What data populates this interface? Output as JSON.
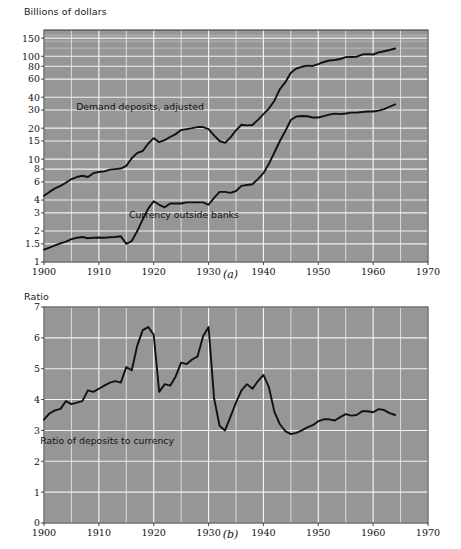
{
  "figure": {
    "background": "#ffffff",
    "plot_background": "#969696",
    "grid_color": "#f2f2f2",
    "line_color": "#111111",
    "axis_color": "#333333"
  },
  "panel_a": {
    "caption": "(a)",
    "axis_title": "Billions of dollars"
  },
  "panel_b": {
    "caption": "(b)",
    "axis_title": "Ratio"
  },
  "chart_data": [
    {
      "type": "line",
      "panel": "(a)",
      "title": "",
      "ylabel": "Billions of dollars",
      "xlabel": "",
      "yscale": "log",
      "ylim": [
        1,
        180
      ],
      "xlim": [
        1900,
        1970
      ],
      "grid": true,
      "legend": "inline-annotations",
      "ytick_labels": [
        "1",
        "1.5",
        "2",
        "3",
        "4",
        "6",
        "8",
        "10",
        "15",
        "20",
        "30",
        "40",
        "60",
        "80",
        "100",
        "150"
      ],
      "ytick_values": [
        1,
        1.5,
        2,
        3,
        4,
        6,
        8,
        10,
        15,
        20,
        30,
        40,
        60,
        80,
        100,
        150
      ],
      "xtick_labels": [
        "1900",
        "1910",
        "1920",
        "1930",
        "1940",
        "1950",
        "1960",
        "1970"
      ],
      "xtick_values": [
        1900,
        1910,
        1920,
        1930,
        1940,
        1950,
        1960,
        1970
      ],
      "series": [
        {
          "name": "Demand deposits, adjusted",
          "label_x": 1917.5,
          "label_y": 30,
          "x": [
            1900,
            1901,
            1902,
            1903,
            1904,
            1905,
            1906,
            1907,
            1908,
            1909,
            1910,
            1911,
            1912,
            1913,
            1914,
            1915,
            1916,
            1917,
            1918,
            1919,
            1920,
            1921,
            1922,
            1923,
            1924,
            1925,
            1926,
            1927,
            1928,
            1929,
            1930,
            1931,
            1932,
            1933,
            1934,
            1935,
            1936,
            1937,
            1938,
            1939,
            1940,
            1941,
            1942,
            1943,
            1944,
            1945,
            1946,
            1947,
            1948,
            1949,
            1950,
            1951,
            1952,
            1953,
            1954,
            1955,
            1956,
            1957,
            1958,
            1959,
            1960,
            1961,
            1962,
            1963,
            1964
          ],
          "y": [
            4.4,
            4.8,
            5.2,
            5.5,
            5.9,
            6.4,
            6.7,
            6.9,
            6.7,
            7.3,
            7.5,
            7.6,
            7.9,
            8.0,
            8.1,
            8.6,
            10.2,
            11.5,
            12.0,
            14.2,
            16.0,
            14.6,
            15.3,
            16.4,
            17.5,
            19.2,
            19.6,
            20.0,
            20.5,
            20.5,
            19.6,
            17.0,
            15.0,
            14.4,
            16.3,
            19.0,
            21.6,
            21.3,
            21.5,
            24.1,
            27.4,
            31.0,
            37.0,
            48.0,
            56.0,
            69.0,
            76.0,
            79.0,
            81.0,
            80.5,
            84.0,
            88.0,
            91.0,
            92.0,
            94.0,
            98.0,
            98.5,
            99.0,
            104.0,
            105.0,
            104.0,
            109.0,
            112.0,
            115.0,
            119.0
          ]
        },
        {
          "name": "Currency outside banks",
          "label_x": 1925.5,
          "label_y": 2.65,
          "x": [
            1900,
            1901,
            1902,
            1903,
            1904,
            1905,
            1906,
            1907,
            1908,
            1909,
            1910,
            1911,
            1912,
            1913,
            1914,
            1915,
            1916,
            1917,
            1918,
            1919,
            1920,
            1921,
            1922,
            1923,
            1924,
            1925,
            1926,
            1927,
            1928,
            1929,
            1930,
            1931,
            1932,
            1933,
            1934,
            1935,
            1936,
            1937,
            1938,
            1939,
            1940,
            1941,
            1942,
            1943,
            1944,
            1945,
            1946,
            1947,
            1948,
            1949,
            1950,
            1951,
            1952,
            1953,
            1954,
            1955,
            1956,
            1957,
            1958,
            1959,
            1960,
            1961,
            1962,
            1963,
            1964
          ],
          "y": [
            1.32,
            1.38,
            1.45,
            1.52,
            1.58,
            1.67,
            1.72,
            1.75,
            1.7,
            1.72,
            1.73,
            1.72,
            1.74,
            1.75,
            1.78,
            1.5,
            1.6,
            2.0,
            2.6,
            3.3,
            3.9,
            3.6,
            3.4,
            3.7,
            3.7,
            3.7,
            3.8,
            3.8,
            3.8,
            3.8,
            3.6,
            4.2,
            4.8,
            4.8,
            4.7,
            4.9,
            5.5,
            5.6,
            5.7,
            6.4,
            7.3,
            9.0,
            11.6,
            15.0,
            18.8,
            24.0,
            26.0,
            26.3,
            26.1,
            25.4,
            25.4,
            26.2,
            27.1,
            27.7,
            27.4,
            27.8,
            28.3,
            28.3,
            28.7,
            29.0,
            29.0,
            29.6,
            30.6,
            32.3,
            34.0
          ]
        }
      ]
    },
    {
      "type": "line",
      "panel": "(b)",
      "title": "",
      "ylabel": "Ratio",
      "xlabel": "",
      "yscale": "linear",
      "ylim": [
        0,
        7
      ],
      "xlim": [
        1900,
        1970
      ],
      "grid": true,
      "ytick_labels": [
        "0",
        "1",
        "2",
        "3",
        "4",
        "5",
        "6",
        "7"
      ],
      "ytick_values": [
        0,
        1,
        2,
        3,
        4,
        5,
        6,
        7
      ],
      "xtick_labels": [
        "1900",
        "1910",
        "1920",
        "1930",
        "1940",
        "1950",
        "1960",
        "1970"
      ],
      "xtick_values": [
        1900,
        1910,
        1920,
        1930,
        1940,
        1950,
        1960,
        1970
      ],
      "series": [
        {
          "name": "Ratio of deposits to currency",
          "label_x": 1911.5,
          "label_y": 2.55,
          "x": [
            1900,
            1901,
            1902,
            1903,
            1904,
            1905,
            1906,
            1907,
            1908,
            1909,
            1910,
            1911,
            1912,
            1913,
            1914,
            1915,
            1916,
            1917,
            1918,
            1919,
            1920,
            1921,
            1922,
            1923,
            1924,
            1925,
            1926,
            1927,
            1928,
            1929,
            1930,
            1931,
            1932,
            1933,
            1934,
            1935,
            1936,
            1937,
            1938,
            1939,
            1940,
            1941,
            1942,
            1943,
            1944,
            1945,
            1946,
            1947,
            1948,
            1949,
            1950,
            1951,
            1952,
            1953,
            1954,
            1955,
            1956,
            1957,
            1958,
            1959,
            1960,
            1961,
            1962,
            1963,
            1964
          ],
          "y": [
            3.35,
            3.55,
            3.65,
            3.7,
            3.95,
            3.85,
            3.9,
            3.95,
            4.3,
            4.25,
            4.35,
            4.45,
            4.55,
            4.6,
            4.55,
            5.05,
            4.95,
            5.75,
            6.25,
            6.35,
            6.1,
            4.25,
            4.5,
            4.45,
            4.75,
            5.2,
            5.15,
            5.3,
            5.4,
            6.05,
            6.35,
            4.05,
            3.15,
            3.0,
            3.45,
            3.9,
            4.3,
            4.5,
            4.35,
            4.6,
            4.8,
            4.4,
            3.6,
            3.2,
            2.98,
            2.88,
            2.92,
            3.0,
            3.1,
            3.17,
            3.3,
            3.36,
            3.36,
            3.32,
            3.43,
            3.53,
            3.48,
            3.5,
            3.62,
            3.62,
            3.59,
            3.69,
            3.66,
            3.56,
            3.5
          ]
        }
      ]
    }
  ]
}
